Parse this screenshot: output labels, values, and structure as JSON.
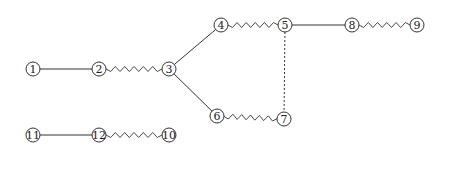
{
  "diagram": {
    "type": "graph",
    "node_radius": 7,
    "nodes": [
      {
        "id": "1",
        "label": "1",
        "x": 33,
        "y": 69
      },
      {
        "id": "2",
        "label": "2",
        "x": 99,
        "y": 69
      },
      {
        "id": "3",
        "label": "3",
        "x": 169,
        "y": 69
      },
      {
        "id": "4",
        "label": "4",
        "x": 221,
        "y": 25
      },
      {
        "id": "5",
        "label": "5",
        "x": 285,
        "y": 25
      },
      {
        "id": "6",
        "label": "6",
        "x": 217,
        "y": 116
      },
      {
        "id": "7",
        "label": "7",
        "x": 284,
        "y": 119
      },
      {
        "id": "8",
        "label": "8",
        "x": 352,
        "y": 25
      },
      {
        "id": "9",
        "label": "9",
        "x": 417,
        "y": 25
      },
      {
        "id": "10",
        "label": "10",
        "x": 169,
        "y": 135
      },
      {
        "id": "11",
        "label": "11",
        "x": 33,
        "y": 135
      },
      {
        "id": "12",
        "label": "12",
        "x": 99,
        "y": 135
      }
    ],
    "edges": [
      {
        "from": "1",
        "to": "2",
        "style": "solid"
      },
      {
        "from": "2",
        "to": "3",
        "style": "spring"
      },
      {
        "from": "3",
        "to": "4",
        "style": "solid"
      },
      {
        "from": "3",
        "to": "6",
        "style": "solid"
      },
      {
        "from": "4",
        "to": "5",
        "style": "spring"
      },
      {
        "from": "5",
        "to": "8",
        "style": "solid"
      },
      {
        "from": "8",
        "to": "9",
        "style": "spring"
      },
      {
        "from": "5",
        "to": "7",
        "style": "dashed"
      },
      {
        "from": "6",
        "to": "7",
        "style": "spring"
      },
      {
        "from": "11",
        "to": "12",
        "style": "solid"
      },
      {
        "from": "12",
        "to": "10",
        "style": "spring"
      }
    ],
    "colors": {
      "stroke": "#333333",
      "text": "#222222",
      "background": "#ffffff"
    }
  }
}
